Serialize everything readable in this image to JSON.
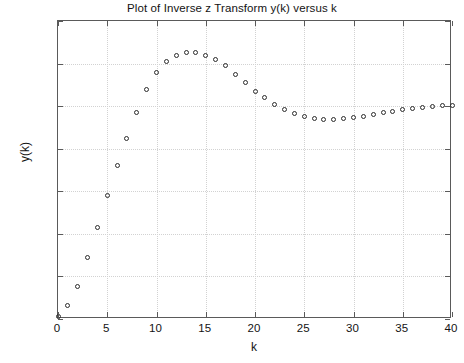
{
  "chart_data": {
    "type": "scatter",
    "title": "Plot of Inverse z Transform y(k) versus k",
    "xlabel": "k",
    "ylabel": "y(k)",
    "xlim": [
      0,
      40
    ],
    "ylim": [
      0,
      1.4
    ],
    "grid": true,
    "legend": null,
    "marker": "open-circle",
    "marker_color": "#2b2b2b",
    "xticks": [
      0,
      5,
      10,
      15,
      20,
      25,
      30,
      35,
      40
    ],
    "xtick_labels": [
      "0",
      "5",
      "10",
      "15",
      "20",
      "25",
      "30",
      "35",
      "40"
    ],
    "yticks": [
      0,
      0.2,
      0.4,
      0.6,
      0.8,
      1,
      1.2,
      1.4
    ],
    "ytick_labels": [
      "0",
      "0.2",
      "0.4",
      "0.6",
      "0.8",
      "1",
      "1.2",
      "1.4"
    ],
    "x": [
      0,
      1,
      2,
      3,
      4,
      5,
      6,
      7,
      8,
      9,
      10,
      11,
      12,
      13,
      14,
      15,
      16,
      17,
      18,
      19,
      20,
      21,
      22,
      23,
      24,
      25,
      26,
      27,
      28,
      29,
      30,
      31,
      32,
      33,
      34,
      35,
      36,
      37,
      38,
      39,
      40
    ],
    "y": [
      0.01,
      0.065,
      0.155,
      0.29,
      0.43,
      0.58,
      0.72,
      0.85,
      0.97,
      1.08,
      1.16,
      1.21,
      1.24,
      1.25,
      1.25,
      1.24,
      1.22,
      1.19,
      1.15,
      1.11,
      1.07,
      1.04,
      1.01,
      0.985,
      0.965,
      0.95,
      0.942,
      0.938,
      0.938,
      0.94,
      0.945,
      0.952,
      0.96,
      0.968,
      0.976,
      0.983,
      0.99,
      0.995,
      0.999,
      1.002,
      1.004
    ]
  }
}
